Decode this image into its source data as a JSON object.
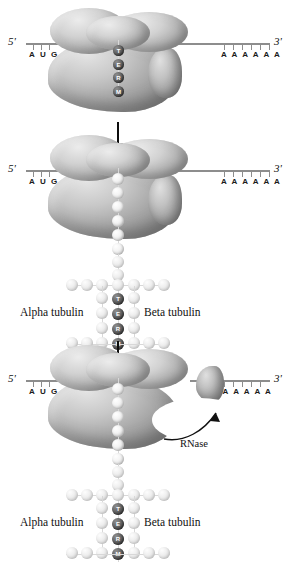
{
  "diagram": {
    "background_color": "#ffffff",
    "arrow_color": "#0d0d0d",
    "mrna_color": "#8d8d8d",
    "bead_dark_color": "#4a4a4a",
    "bead_light_color": "#eeeeee"
  },
  "mrna": {
    "five_prime": "5'",
    "three_prime": "3'",
    "start_codon": "A U G",
    "poly_a_tail": "A A A A A A",
    "poly_a_count": 6,
    "start_codon_tick_count": 3
  },
  "nascent_peptide": {
    "residues": [
      "T",
      "E",
      "R",
      "M"
    ],
    "label": "TERM"
  },
  "microtubule": {
    "alpha_label": "Alpha tubulin",
    "beta_label": "Beta tubulin"
  },
  "enzyme": {
    "rnase_label": "RNase"
  },
  "panels": [
    {
      "id": "panel-1",
      "name": "ribosome-translating-mrna",
      "caption": "Ribosome assembled on mRNA, nascent TERM peptide inside"
    },
    {
      "id": "panel-2",
      "name": "polypeptide-elongating",
      "caption": "Polypeptide chain extruded, tubulin lattice assembling"
    },
    {
      "id": "panel-3",
      "name": "rnase-cleaving-mrna",
      "caption": "RNase cleaves the mRNA at the 3' region"
    }
  ]
}
